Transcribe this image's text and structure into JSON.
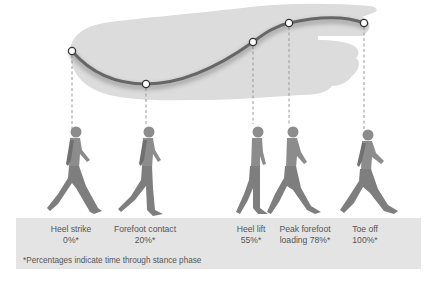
{
  "diagram": {
    "colors": {
      "foot_fill": "#dcdcdc",
      "curve": "#666666",
      "point_fill": "#ffffff",
      "point_stroke": "#333333",
      "dash": "#999999",
      "figure": "#8a8a8a",
      "caption_bg": "#e4e4e4",
      "text": "#555555"
    },
    "phases": [
      {
        "name": "Heel strike",
        "percent": "0%*",
        "line1": "Heel strike",
        "line2": "0%*",
        "x": 72,
        "y": 51
      },
      {
        "name": "Forefoot contact",
        "percent": "20%*",
        "line1": "Forefoot contact",
        "line2": "20%*",
        "x": 146,
        "y": 84
      },
      {
        "name": "Heel lift",
        "percent": "55%*",
        "line1": "Heel lift",
        "line2": "55%*",
        "x": 253,
        "y": 42
      },
      {
        "name": "Peak forefoot loading",
        "percent": "78%*",
        "line1": "Peak forefoot",
        "line2": "loading 78%*",
        "x": 289,
        "y": 23
      },
      {
        "name": "Toe off",
        "percent": "100%*",
        "line1": "Toe off",
        "line2": "100%*",
        "x": 364,
        "y": 23
      }
    ],
    "footnote": "*Percentages indicate time through stance phase"
  }
}
